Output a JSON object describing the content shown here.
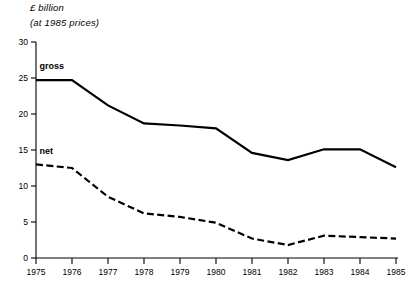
{
  "labels": {
    "unit": "£ billion",
    "basis": "(at 1985 prices)"
  },
  "chart_data": {
    "type": "line",
    "title": "",
    "subtitle": "",
    "xlabel": "",
    "ylabel": "£ billion (at 1985 prices)",
    "grid": false,
    "legend_position": "inline-on-plot",
    "categories": [
      "1975",
      "1976",
      "1977",
      "1978",
      "1979",
      "1980",
      "1981",
      "1982",
      "1983",
      "1984",
      "1985"
    ],
    "x": [
      1975,
      1976,
      1977,
      1978,
      1979,
      1980,
      1981,
      1982,
      1983,
      1984,
      1985
    ],
    "xlim": [
      1975,
      1985
    ],
    "ylim": [
      0,
      30
    ],
    "yticks": [
      0,
      5,
      10,
      15,
      20,
      25,
      30
    ],
    "ytick_labels": [
      "0",
      "5",
      "10",
      "15",
      "20",
      "25",
      "30"
    ],
    "xticks": [
      1975,
      1976,
      1977,
      1978,
      1979,
      1980,
      1981,
      1982,
      1983,
      1984,
      1985
    ],
    "xtick_labels": [
      "1975",
      "1976",
      "1977",
      "1978",
      "1979",
      "1980",
      "1981",
      "1982",
      "1983",
      "1984",
      "1985"
    ],
    "series": [
      {
        "name": "gross",
        "style": "solid",
        "color": "#000000",
        "values": [
          24.7,
          24.7,
          21.2,
          18.7,
          18.4,
          18.0,
          14.6,
          13.6,
          15.1,
          15.1,
          12.6
        ]
      },
      {
        "name": "net",
        "style": "dashed",
        "color": "#000000",
        "values": [
          13.0,
          12.5,
          8.5,
          6.2,
          5.7,
          4.9,
          2.7,
          1.8,
          3.1,
          2.9,
          2.7
        ]
      }
    ],
    "annotations": [
      {
        "text": "gross",
        "series": "gross",
        "x": 1975.1,
        "y": 26.2
      },
      {
        "text": "net",
        "series": "net",
        "x": 1975.1,
        "y": 14.4
      }
    ]
  }
}
